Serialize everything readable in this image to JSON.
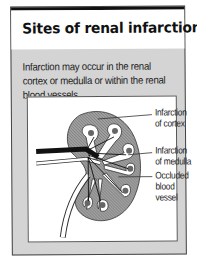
{
  "card": {
    "title": "Sites of renal infarction",
    "description": "Infarction may occur in the renal cortex or medulla or within the renal blood vessels."
  },
  "figure": {
    "labels": [
      {
        "line1": "Infarction",
        "line2": "of cortex",
        "line3": ""
      },
      {
        "line1": "Infarction",
        "line2": "of medulla",
        "line3": ""
      },
      {
        "line1": "Occluded",
        "line2": "blood",
        "line3": "vessel"
      }
    ]
  },
  "colors": {
    "panel_background": "#d4d4d4",
    "title_background": "#ffffff",
    "cortex_fill": "#9a9a9a",
    "top_rule": "#111111"
  }
}
